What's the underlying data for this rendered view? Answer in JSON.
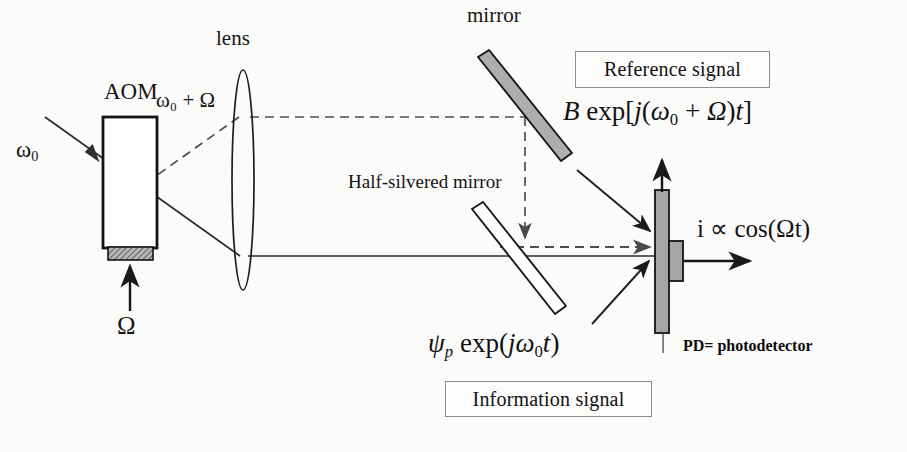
{
  "figure": {
    "background_color": "#fbfbfa",
    "ink_color": "#1a1a1a",
    "component_fill_gray": "#a8a8a8"
  },
  "labels": {
    "aom": "AOM",
    "lens": "lens",
    "mirror": "mirror",
    "half_silvered_mirror": "Half-silvered mirror",
    "omega_in": "ω",
    "omega_in_sub": "0",
    "omega_drive": "Ω",
    "diffracted": "ω₀ + Ω",
    "pd_note": "PD= photodetector",
    "separator": "|"
  },
  "boxes": {
    "reference_signal": "Reference signal",
    "information_signal": "Information signal"
  },
  "equations": {
    "reference": "B exp[j(ω₀ + Ω)t]",
    "information": "ψₚ exp(jω₀t)",
    "photocurrent": "i ∝ cos(Ωt)"
  },
  "equation_parts": {
    "reference": {
      "amplitude": "B",
      "func": "exp",
      "open": "[",
      "j": "j",
      "paren_open": "(",
      "omega": "ω",
      "omega_sub": "0",
      "plus": "+",
      "Omega": "Ω",
      "paren_close": ")",
      "t": "t",
      "close": "]"
    },
    "information": {
      "psi": "ψ",
      "psi_sub": "p",
      "func": "exp",
      "paren_open": "(",
      "j": "j",
      "omega": "ω",
      "omega_sub": "0",
      "t": "t",
      "paren_close": ")"
    },
    "photocurrent": {
      "i": "i",
      "prop": "∝",
      "cos": "cos(",
      "Omega": "Ω",
      "t": "t",
      "close": ")"
    }
  },
  "components": [
    {
      "name": "aom-body",
      "type": "rect",
      "x": 103,
      "y": 117,
      "w": 54,
      "h": 131,
      "fill": "#ffffff",
      "stroke": "#141414",
      "stroke_width": 2.6
    },
    {
      "name": "aom-transducer",
      "type": "rect",
      "x": 108,
      "y": 248,
      "w": 44,
      "h": 12,
      "fill": "#9b9b9b",
      "stroke": "#141414",
      "stroke_width": 1.6
    },
    {
      "name": "lens",
      "type": "ellipse",
      "cx": 243,
      "cy": 180,
      "rx": 11,
      "ry": 110,
      "fill": "#ffffff",
      "stroke": "#1d1d1d",
      "stroke_width": 1.7
    },
    {
      "name": "mirror",
      "type": "bar",
      "x1": 483,
      "y1": 63,
      "x2": 566,
      "y2": 155,
      "thickness": 13,
      "fill": "#adadad",
      "stroke": "#161616",
      "stroke_width": 1.8
    },
    {
      "name": "half-silvered-mirror",
      "type": "bar",
      "x1": 478,
      "y1": 214,
      "x2": 558,
      "y2": 312,
      "thickness": 13,
      "fill": "#ffffff",
      "stroke": "#161616",
      "stroke_width": 1.8
    },
    {
      "name": "photodetector-bar",
      "type": "rect",
      "x": 655,
      "y": 190,
      "w": 14,
      "h": 143,
      "fill": "#a5a5a5",
      "stroke": "#141414",
      "stroke_width": 1.8
    },
    {
      "name": "photodetector-tab",
      "type": "rect",
      "x": 669,
      "y": 241,
      "w": 13,
      "h": 40,
      "fill": "#a5a5a5",
      "stroke": "#141414",
      "stroke_width": 1.8
    }
  ],
  "beams": [
    {
      "name": "input-beam-omega0",
      "style": "solid",
      "points": "45,117 240,256",
      "arrow_at": "100,155"
    },
    {
      "name": "diffracted-beam-dashed",
      "style": "dashed",
      "points": "146,183 238,118"
    },
    {
      "name": "collimated-upper-dashed",
      "style": "dashed",
      "points": "248,117 525,117"
    },
    {
      "name": "mirror-reflected-dashed",
      "style": "dashed",
      "points": "525,117 525,243",
      "arrow": "down"
    },
    {
      "name": "beamsplitter-to-pd-dashed",
      "style": "dashed",
      "points": "525,243 652,243",
      "arrow": "right"
    },
    {
      "name": "collimated-lower-solid",
      "style": "solid",
      "points": "248,256 655,256"
    },
    {
      "name": "pd-output-up",
      "style": "solid",
      "points": "662,190 662,158",
      "arrow": "up"
    },
    {
      "name": "pd-output-right",
      "style": "solid",
      "points": "682,261 752,261",
      "arrow": "right"
    },
    {
      "name": "reference-pointer",
      "style": "solid",
      "points": "578,172 652,232",
      "arrow": "end"
    },
    {
      "name": "information-pointer",
      "style": "solid",
      "points": "592,325 651,259",
      "arrow": "end"
    },
    {
      "name": "aom-drive-arrow",
      "style": "solid",
      "points": "130,310 130,262",
      "arrow": "up"
    }
  ],
  "positions": {
    "aom": {
      "x": 104,
      "y": 82
    },
    "lens": {
      "x": 216,
      "y": 30
    },
    "mirror": {
      "x": 467,
      "y": 7
    },
    "half_silvered": {
      "x": 348,
      "y": 173
    },
    "omega_in": {
      "x": 17,
      "y": 141
    },
    "omega_drive": {
      "x": 118,
      "y": 316
    },
    "diffracted": {
      "x": 157,
      "y": 92
    },
    "reference_box": {
      "x": 575,
      "y": 51,
      "w": 193,
      "h": 35
    },
    "information_box": {
      "x": 445,
      "y": 381,
      "w": 205,
      "h": 34
    },
    "reference_eq": {
      "x": 563,
      "y": 100
    },
    "information_eq": {
      "x": 428,
      "y": 332
    },
    "photocurrent_eq": {
      "x": 697,
      "y": 217
    },
    "pd_note": {
      "x": 683,
      "y": 339
    },
    "separator": {
      "x": 661,
      "y": 334
    }
  }
}
